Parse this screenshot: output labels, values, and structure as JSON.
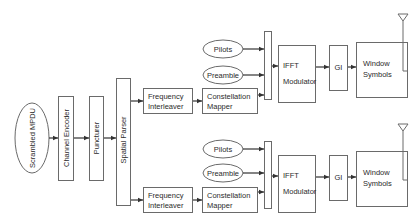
{
  "diagram": {
    "source": {
      "label": "Scrambled MPDU"
    },
    "shared_blocks": [
      {
        "id": "channel-encoder",
        "label": "Channel Encoder"
      },
      {
        "id": "puncturer",
        "label": "Puncturer"
      },
      {
        "id": "spatial-parser",
        "label": "Spatial Parser"
      }
    ],
    "streams": [
      {
        "name": "stream-1",
        "freq_interleaver": [
          "Frequency",
          "Interleaver"
        ],
        "constellation_mapper": [
          "Constellation",
          "Mapper"
        ],
        "pilots": "Pilots",
        "preamble": "Preamble",
        "ifft": [
          "IFFT",
          "Modulator"
        ],
        "gi": "GI",
        "window": [
          "Window",
          "Symbols"
        ]
      },
      {
        "name": "stream-2",
        "freq_interleaver": [
          "Frequency",
          "Interleaver"
        ],
        "constellation_mapper": [
          "Constellation",
          "Mapper"
        ],
        "pilots": "Pilots",
        "preamble": "Preamble",
        "ifft": [
          "IFFT",
          "Modulator"
        ],
        "gi": "GI",
        "window": [
          "Window",
          "Symbols"
        ]
      }
    ],
    "colors": {
      "stroke": "#555555",
      "text": "#2b2b2b",
      "background": "#ffffff"
    }
  }
}
